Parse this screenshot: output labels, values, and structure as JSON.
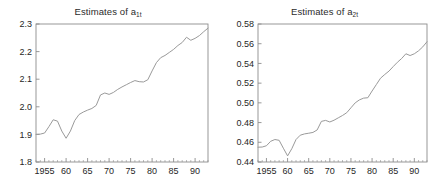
{
  "figure": {
    "background": "#ffffff",
    "line_color": "#9a9a9a",
    "axis_color": "#8d8d8d",
    "text_color": "#262626"
  },
  "panels": [
    {
      "id": "left",
      "title_prefix": "Estimates of a",
      "title_subscript": "1t"
    },
    {
      "id": "right",
      "title_prefix": "Estimates of a",
      "title_subscript": "2t"
    }
  ],
  "chart_data": [
    {
      "type": "line",
      "title": "Estimates of a1t",
      "xlabel": "",
      "ylabel": "",
      "xlim": [
        1953,
        1993
      ],
      "ylim": [
        1.8,
        2.3
      ],
      "grid": false,
      "legend": null,
      "xticks": [
        1955,
        1960,
        1965,
        1970,
        1975,
        1980,
        1985,
        1990
      ],
      "xticklabels": [
        "1955",
        "60",
        "65",
        "70",
        "75",
        "80",
        "85",
        "90"
      ],
      "yticks": [
        1.8,
        1.9,
        2.0,
        2.1,
        2.2,
        2.3
      ],
      "yticklabels": [
        "1.8",
        "1.9",
        "2.0",
        "2.1",
        "2.2",
        "2.3"
      ],
      "x": [
        1953,
        1954,
        1955,
        1956,
        1957,
        1958,
        1959,
        1960,
        1961,
        1962,
        1963,
        1964,
        1965,
        1966,
        1967,
        1968,
        1969,
        1970,
        1971,
        1972,
        1973,
        1974,
        1975,
        1976,
        1977,
        1978,
        1979,
        1980,
        1981,
        1982,
        1983,
        1984,
        1985,
        1986,
        1987,
        1988,
        1989,
        1990,
        1991,
        1992,
        1993
      ],
      "values": [
        1.9,
        1.901,
        1.905,
        1.928,
        1.953,
        1.948,
        1.912,
        1.886,
        1.912,
        1.95,
        1.972,
        1.981,
        1.988,
        1.994,
        2.005,
        2.043,
        2.05,
        2.045,
        2.052,
        2.063,
        2.072,
        2.08,
        2.088,
        2.095,
        2.091,
        2.09,
        2.098,
        2.13,
        2.16,
        2.178,
        2.186,
        2.197,
        2.208,
        2.222,
        2.233,
        2.252,
        2.241,
        2.248,
        2.258,
        2.272,
        2.285
      ]
    },
    {
      "type": "line",
      "title": "Estimates of a2t",
      "xlabel": "",
      "ylabel": "",
      "xlim": [
        1953,
        1993
      ],
      "ylim": [
        0.44,
        0.58
      ],
      "grid": false,
      "legend": null,
      "xticks": [
        1955,
        1960,
        1965,
        1970,
        1975,
        1980,
        1985,
        1990
      ],
      "xticklabels": [
        "1955",
        "60",
        "65",
        "70",
        "75",
        "80",
        "85",
        "90"
      ],
      "yticks": [
        0.44,
        0.46,
        0.48,
        0.5,
        0.52,
        0.54,
        0.56,
        0.58
      ],
      "yticklabels": [
        "0.44",
        "0.46",
        "0.48",
        "0.50",
        "0.52",
        "0.54",
        "0.56",
        "0.58"
      ],
      "x": [
        1953,
        1954,
        1955,
        1956,
        1957,
        1958,
        1959,
        1960,
        1961,
        1962,
        1963,
        1964,
        1965,
        1966,
        1967,
        1968,
        1969,
        1970,
        1971,
        1972,
        1973,
        1974,
        1975,
        1976,
        1977,
        1978,
        1979,
        1980,
        1981,
        1982,
        1983,
        1984,
        1985,
        1986,
        1987,
        1988,
        1989,
        1990,
        1991,
        1992,
        1993
      ],
      "values": [
        0.455,
        0.4552,
        0.4565,
        0.461,
        0.4628,
        0.462,
        0.454,
        0.4462,
        0.4535,
        0.4628,
        0.4672,
        0.4685,
        0.4692,
        0.47,
        0.4725,
        0.4812,
        0.4822,
        0.4806,
        0.4824,
        0.4848,
        0.4872,
        0.49,
        0.495,
        0.5,
        0.503,
        0.5048,
        0.5052,
        0.512,
        0.5185,
        0.525,
        0.5288,
        0.5322,
        0.5368,
        0.5412,
        0.545,
        0.5498,
        0.548,
        0.5498,
        0.5528,
        0.5568,
        0.562
      ]
    }
  ]
}
